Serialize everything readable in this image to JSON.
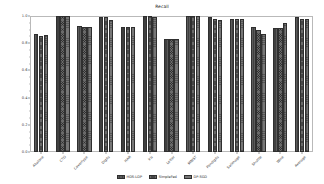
{
  "chart_data": {
    "type": "bar",
    "title": "Recall",
    "xlabel": "",
    "ylabel": "",
    "ylim": [
      0.0,
      1.0
    ],
    "yticks": [
      "0.0",
      "0.2",
      "0.4",
      "0.6",
      "0.8",
      "1.0"
    ],
    "grid": false,
    "legend_position": "bottom-center",
    "categories": [
      "Abalone",
      "CTG",
      "Covertype",
      "Digits",
      "HAR",
      "Iris",
      "Letter",
      "MNIST",
      "Pendigits",
      "Satimage",
      "Shuttle",
      "Wine",
      "Average"
    ],
    "series": [
      {
        "name": "HDS-LDP",
        "values": [
          0.87,
          1.0,
          0.93,
          0.99,
          0.92,
          1.0,
          0.83,
          1.0,
          0.99,
          0.98,
          0.92,
          0.91,
          0.99
        ]
      },
      {
        "name": "SimpleFed",
        "values": [
          0.85,
          1.0,
          0.92,
          0.99,
          0.92,
          1.0,
          0.83,
          1.0,
          0.98,
          0.98,
          0.9,
          0.91,
          0.98
        ]
      },
      {
        "name": "DP-SGD",
        "values": [
          0.86,
          1.0,
          0.92,
          0.97,
          0.92,
          0.99,
          0.83,
          1.0,
          0.97,
          0.98,
          0.87,
          0.95,
          0.98
        ]
      }
    ]
  }
}
